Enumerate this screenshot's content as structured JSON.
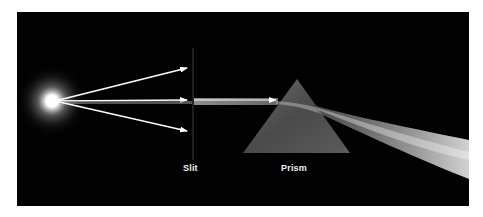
{
  "diagram": {
    "labels": {
      "slit": "Slit",
      "prism": "Prism"
    },
    "colors": {
      "background": "#020202",
      "page": "#ffffff",
      "light": "#ffffff",
      "prism": "#5a5a5a",
      "label": "#f0f0f0"
    },
    "elements": [
      "light-source",
      "arrow-up",
      "arrow-middle",
      "arrow-down",
      "slit",
      "collimated-beam",
      "prism",
      "dispersed-beam"
    ]
  }
}
